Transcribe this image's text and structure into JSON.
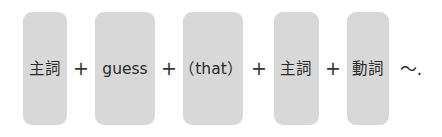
{
  "formula": {
    "slots": [
      {
        "label": "主詞"
      },
      {
        "label": "guess"
      },
      {
        "label": "（that）"
      },
      {
        "label": "主詞"
      },
      {
        "label": "動詞"
      }
    ],
    "operators": [
      "+",
      "+",
      "+",
      "+"
    ],
    "ending": "～."
  },
  "colors": {
    "slot_background": "#d8d8d8",
    "text": "#2a2a2a"
  }
}
